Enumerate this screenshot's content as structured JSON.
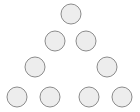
{
  "figure": {
    "name": "triangular-dot-pattern",
    "width": 140,
    "height": 112,
    "background_color": "#ffffff",
    "circle_fill": "#ededed",
    "circle_stroke": "#8c8c8c",
    "circle_stroke_width": 1,
    "circle_radius": 10,
    "total_circles": 9,
    "rows": [
      {
        "index": 1,
        "count": 1,
        "y": 14,
        "circles": [
          {
            "id": "circle-r1-c1",
            "cx": 71,
            "cy": 14,
            "r": 10
          }
        ]
      },
      {
        "index": 2,
        "count": 2,
        "y": 41,
        "circles": [
          {
            "id": "circle-r2-c1",
            "cx": 55,
            "cy": 41,
            "r": 10
          },
          {
            "id": "circle-r2-c2",
            "cx": 86,
            "cy": 41,
            "r": 10
          }
        ]
      },
      {
        "index": 3,
        "count": 2,
        "y": 67,
        "circles": [
          {
            "id": "circle-r3-c1",
            "cx": 35,
            "cy": 67,
            "r": 10
          },
          {
            "id": "circle-r3-c2",
            "cx": 107,
            "cy": 67,
            "r": 10
          }
        ]
      },
      {
        "index": 4,
        "count": 4,
        "y": 97,
        "circles": [
          {
            "id": "circle-r4-c1",
            "cx": 17,
            "cy": 97,
            "r": 10
          },
          {
            "id": "circle-r4-c2",
            "cx": 50,
            "cy": 97,
            "r": 10
          },
          {
            "id": "circle-r4-c3",
            "cx": 89,
            "cy": 97,
            "r": 10
          },
          {
            "id": "circle-r4-c4",
            "cx": 122,
            "cy": 97,
            "r": 10
          }
        ]
      }
    ]
  }
}
